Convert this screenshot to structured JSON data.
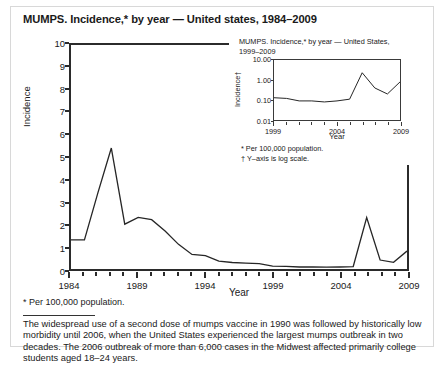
{
  "main": {
    "title": "MUMPS. Incidence,* by year — United states, 1984–2009",
    "footnote": "* Per 100,000 population.",
    "body_paragraph": "The widespread use of a second dose of mumps vaccine in 1990 was followed by historically low morbidity until 2006, when the United States experienced the largest mumps outbreak in two decades. The 2006 outbreak of more than 6,000 cases in the Midwest affected primarily college students aged 18–24 years."
  },
  "inset": {
    "title_line1": "MUMPS. Incidence,* by year — United States,",
    "title_line2": "1999–2009",
    "note1": "* Per 100,000 population.",
    "note2": "† Y–axis is log scale."
  },
  "chart_data": [
    {
      "id": "main",
      "type": "line",
      "title": "MUMPS. Incidence,* by year — United states, 1984–2009",
      "xlabel": "Year",
      "ylabel": "Incidence",
      "xlim": [
        1984,
        2009
      ],
      "ylim": [
        0,
        10
      ],
      "ytick_labels": [
        "0",
        "1",
        "2",
        "3",
        "4",
        "5",
        "6",
        "7",
        "8",
        "9",
        "10"
      ],
      "ytick_values": [
        0,
        1,
        2,
        3,
        4,
        5,
        6,
        7,
        8,
        9,
        10
      ],
      "xtick_labels": [
        "1984",
        "1989",
        "1994",
        "1999",
        "2004",
        "2009"
      ],
      "xtick_values": [
        1984,
        1989,
        1994,
        1999,
        2004,
        2009
      ],
      "grid": false,
      "legend": "none",
      "x": [
        1984,
        1985,
        1986,
        1987,
        1988,
        1989,
        1990,
        1991,
        1992,
        1993,
        1994,
        1995,
        1996,
        1997,
        1998,
        1999,
        2000,
        2001,
        2002,
        2003,
        2004,
        2005,
        2006,
        2007,
        2008,
        2009
      ],
      "values": [
        1.3,
        1.3,
        3.4,
        5.4,
        2.0,
        2.3,
        2.2,
        1.7,
        1.1,
        0.65,
        0.6,
        0.35,
        0.29,
        0.26,
        0.24,
        0.13,
        0.12,
        0.09,
        0.09,
        0.08,
        0.09,
        0.11,
        2.3,
        0.4,
        0.3,
        0.8
      ]
    },
    {
      "id": "inset",
      "type": "line",
      "title": "MUMPS. Incidence,* by year — United States, 1999–2009",
      "xlabel": "Year",
      "ylabel": "Incidence†",
      "yscale": "log",
      "xlim": [
        1999,
        2009
      ],
      "ylim": [
        0.01,
        10.0
      ],
      "ytick_labels": [
        "0.01",
        "0.10",
        "1.00",
        "10.00"
      ],
      "ytick_values": [
        0.01,
        0.1,
        1.0,
        10.0
      ],
      "xtick_labels": [
        "1999",
        "2004",
        "2009"
      ],
      "xtick_values": [
        1999,
        2004,
        2009
      ],
      "grid": false,
      "legend": "none",
      "x": [
        1999,
        2000,
        2001,
        2002,
        2003,
        2004,
        2005,
        2006,
        2007,
        2008,
        2009
      ],
      "values": [
        0.13,
        0.12,
        0.09,
        0.09,
        0.08,
        0.09,
        0.11,
        2.3,
        0.4,
        0.2,
        0.8
      ]
    }
  ]
}
